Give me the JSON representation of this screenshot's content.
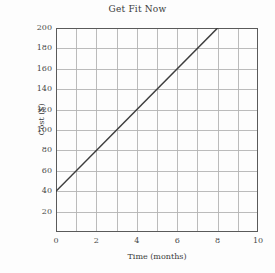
{
  "chart_data": {
    "type": "line",
    "title": "Get Fit Now",
    "xlabel": "Time (months)",
    "ylabel": "Cost ($)",
    "xlim": [
      0,
      10
    ],
    "ylim": [
      0,
      200
    ],
    "grid": true,
    "legend": "none",
    "x_ticks": [
      0,
      2,
      4,
      6,
      8,
      10
    ],
    "x_tick_labels": [
      "0",
      "2",
      "4",
      "6",
      "8",
      "10"
    ],
    "x_minor_step": 1,
    "y_ticks": [
      20,
      40,
      60,
      80,
      100,
      120,
      140,
      160,
      180,
      200
    ],
    "y_tick_labels": [
      "20",
      "40",
      "60",
      "80",
      "100",
      "120",
      "140",
      "160",
      "180",
      "200"
    ],
    "y_minor_step": 20,
    "series": [
      {
        "name": "Cost",
        "x": [
          0,
          8
        ],
        "y": [
          40,
          200
        ],
        "intercept": 40,
        "slope": 20,
        "color": "#3d3d3d"
      }
    ]
  },
  "style": {
    "background": "#fdfdfd",
    "grid_color": "#b4b4b4",
    "axis_color": "#5a5a5a",
    "text_color": "#3a3a3a",
    "line_color": "#3d3d3d"
  }
}
